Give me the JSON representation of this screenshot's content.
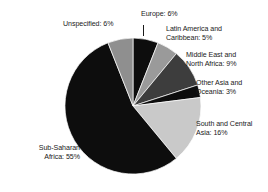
{
  "chart_data": {
    "type": "pie",
    "title": "",
    "subtitle": "",
    "xlabel": "",
    "ylabel": "",
    "legend_position": "none",
    "grid": false,
    "start_angle_deg": 0,
    "direction": "clockwise",
    "categories": [
      "Europe",
      "Latin America and Caribbean",
      "Middle East and North Africa",
      "Other Asia and Oceania",
      "South and Central Asia",
      "Sub-Saharan Africa",
      "Unspecified"
    ],
    "values": [
      6,
      5,
      9,
      3,
      16,
      55,
      6
    ],
    "unit": "%",
    "slices": [
      {
        "name": "Europe",
        "value": 6,
        "label": "Europe: 6%",
        "color": "#0d0d0d"
      },
      {
        "name": "Latin America and Caribbean",
        "value": 5,
        "label": "Latin America and\nCaribbean: 5%",
        "color": "#9a9a9a"
      },
      {
        "name": "Middle East and North Africa",
        "value": 9,
        "label": "Middle East and\nNorth Africa: 9%",
        "color": "#3d3d3d"
      },
      {
        "name": "Other Asia and Oceania",
        "value": 3,
        "label": "Other Asia and\nOceania: 3%",
        "color": "#0d0d0d"
      },
      {
        "name": "South and Central Asia",
        "value": 16,
        "label": "South and Central\nAsia: 16%",
        "color": "#c9c9c9"
      },
      {
        "name": "Sub-Saharan Africa",
        "value": 55,
        "label": "Sub-Saharan\nAfrica: 55%",
        "color": "#0d0d0d"
      },
      {
        "name": "Unspecified",
        "value": 6,
        "label": "Unspecified: 6%",
        "color": "#8f8f8f"
      }
    ]
  },
  "labels": {
    "europe": "Europe: 6%",
    "latin_america": "Latin America and\nCaribbean: 5%",
    "middle_east": "Middle East and\nNorth Africa: 9%",
    "other_asia": "Other Asia and\nOceania: 3%",
    "south_central_asia": "South and Central\nAsia: 16%",
    "sub_saharan_africa": "Sub-Saharan\nAfrica: 55%",
    "unspecified": "Unspecified: 6%"
  },
  "colors": {
    "background": "#ffffff",
    "text": "#1a1a1a",
    "slice_black": "#0d0d0d",
    "slice_dark_gray": "#3d3d3d",
    "slice_medium_gray": "#9a9a9a",
    "slice_light_gray": "#c9c9c9",
    "slice_unspecified_gray": "#8f8f8f",
    "slice_outline": "#ffffff"
  },
  "geometry": {
    "center_x": 133,
    "center_y": 106,
    "radius": 68
  }
}
